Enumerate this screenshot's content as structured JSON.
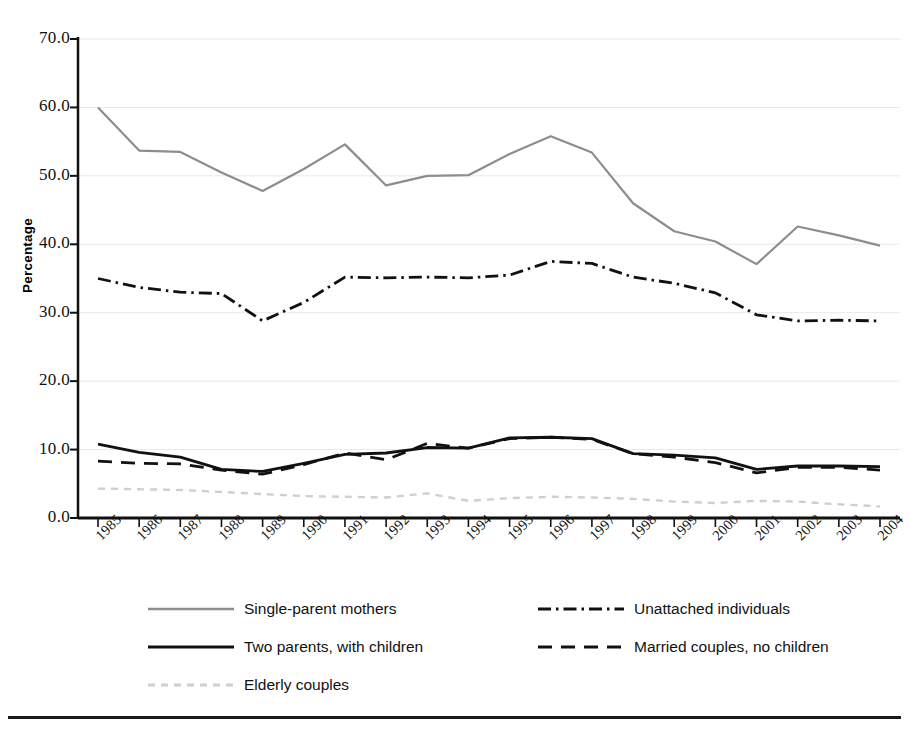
{
  "chart_data": {
    "type": "line",
    "title": "",
    "xlabel": "",
    "ylabel": "Percentage",
    "grid": true,
    "legend_position": "below-plot",
    "xlim": [
      1985,
      2004
    ],
    "ylim": [
      0.0,
      70.0
    ],
    "y_ticks": [
      "70.0",
      "60.0",
      "50.0",
      "40.0",
      "30.0",
      "20.0",
      "10.0",
      "0.0"
    ],
    "y_tick_values": [
      70.0,
      60.0,
      50.0,
      40.0,
      30.0,
      20.0,
      10.0,
      0.0
    ],
    "categories": [
      "1985",
      "1986",
      "1987",
      "1988",
      "1989",
      "1990",
      "1991",
      "1992",
      "1993",
      "1994",
      "1995",
      "1996",
      "1997",
      "1998",
      "1999",
      "2000",
      "2001",
      "2002",
      "2003",
      "2004"
    ],
    "series": [
      {
        "name": "Single-parent mothers",
        "style": "solid",
        "color": "#8d8d8d",
        "width": 2.2,
        "values": [
          60.0,
          53.7,
          53.5,
          50.5,
          47.8,
          51.0,
          54.6,
          48.6,
          50.0,
          50.1,
          53.2,
          55.8,
          53.4,
          46.0,
          41.9,
          40.4,
          37.1,
          42.6,
          41.3,
          39.8
        ]
      },
      {
        "name": "Unattached individuals",
        "style": "dash-dot",
        "color": "#111111",
        "width": 2.8,
        "values": [
          35.0,
          33.7,
          33.0,
          32.8,
          28.8,
          31.5,
          35.2,
          35.1,
          35.2,
          35.1,
          35.5,
          37.5,
          37.2,
          35.2,
          34.3,
          32.9,
          29.7,
          28.8,
          28.9,
          28.8
        ]
      },
      {
        "name": "Two parents, with children",
        "style": "solid",
        "color": "#111111",
        "width": 2.8,
        "values": [
          10.8,
          9.6,
          8.9,
          7.1,
          6.8,
          8.0,
          9.3,
          9.5,
          10.3,
          10.2,
          11.7,
          11.8,
          11.6,
          9.4,
          9.2,
          8.8,
          7.1,
          7.6,
          7.6,
          7.5
        ]
      },
      {
        "name": "Married couples, no children",
        "style": "dashed",
        "color": "#111111",
        "width": 2.8,
        "values": [
          8.3,
          8.0,
          7.9,
          7.0,
          6.4,
          7.8,
          9.5,
          8.5,
          10.9,
          10.2,
          11.6,
          11.8,
          11.5,
          9.4,
          8.9,
          8.1,
          6.6,
          7.4,
          7.4,
          7.0
        ]
      },
      {
        "name": "Elderly couples",
        "style": "dotted",
        "color": "#cfcfcf",
        "width": 2.4,
        "values": [
          4.3,
          4.2,
          4.1,
          3.8,
          3.5,
          3.2,
          3.1,
          3.0,
          3.6,
          2.5,
          2.9,
          3.1,
          3.0,
          2.8,
          2.4,
          2.2,
          2.5,
          2.4,
          2.0,
          1.7
        ]
      }
    ]
  },
  "legend": {
    "rows": [
      [
        {
          "label": "Single-parent mothers",
          "series": 0
        },
        {
          "label": "Unattached individuals",
          "series": 1
        }
      ],
      [
        {
          "label": "Two parents, with children",
          "series": 2
        },
        {
          "label": "Married couples, no children",
          "series": 3
        }
      ],
      [
        {
          "label": "Elderly couples",
          "series": 4
        }
      ]
    ]
  },
  "axis": {
    "line_color": "#111111",
    "grid_color": "#e8e8ef"
  }
}
